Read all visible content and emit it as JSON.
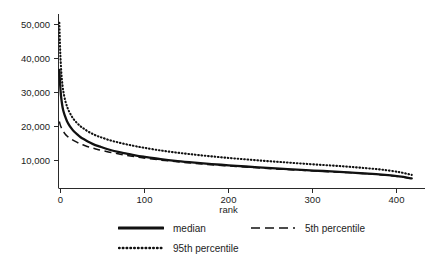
{
  "chart_data": {
    "type": "line",
    "title": "",
    "subtitle": "",
    "xlabel": "rank",
    "ylabel": "",
    "xlim": [
      0,
      420
    ],
    "ylim": [
      5000,
      55000
    ],
    "grid": false,
    "legend_position": "bottom",
    "x_ticks": [
      0,
      100,
      200,
      300,
      400
    ],
    "x_tick_labels": [
      "0",
      "100",
      "200",
      "300",
      "400"
    ],
    "y_ticks": [
      10000,
      20000,
      30000,
      40000,
      50000
    ],
    "y_tick_labels": [
      "10,000",
      "20,000",
      "30,000",
      "40,000",
      "50,000"
    ],
    "x": [
      1,
      2,
      3,
      4,
      5,
      6,
      8,
      10,
      12,
      15,
      18,
      22,
      26,
      30,
      35,
      40,
      45,
      50,
      60,
      70,
      80,
      90,
      100,
      120,
      140,
      160,
      180,
      200,
      220,
      240,
      260,
      280,
      300,
      320,
      340,
      360,
      380,
      400,
      415
    ],
    "series": [
      {
        "name": "median",
        "style": "solid",
        "color": "#111111",
        "values": [
          39000,
          34500,
          31500,
          29500,
          28000,
          27000,
          25500,
          24300,
          23400,
          22300,
          21400,
          20500,
          19700,
          19100,
          18400,
          17800,
          17300,
          16900,
          16100,
          15500,
          15000,
          14500,
          14100,
          13400,
          12850,
          12400,
          12000,
          11650,
          11300,
          11000,
          10700,
          10400,
          10150,
          9900,
          9600,
          9300,
          8950,
          8450,
          7900
        ]
      },
      {
        "name": "5th percentile",
        "style": "dashed",
        "color": "#111111",
        "values": [
          24200,
          23300,
          22600,
          22050,
          21600,
          21200,
          20550,
          20050,
          19650,
          19150,
          18700,
          18200,
          17750,
          17400,
          16950,
          16600,
          16250,
          15950,
          15400,
          14950,
          14500,
          14100,
          13750,
          13150,
          12650,
          12200,
          11800,
          11450,
          11150,
          10850,
          10550,
          10300,
          10050,
          9800,
          9550,
          9250,
          8900,
          8400,
          7850
        ]
      },
      {
        "name": "95th percentile",
        "style": "dotted",
        "color": "#111111",
        "values": [
          52500,
          44500,
          39500,
          36200,
          34000,
          32400,
          30100,
          28500,
          27300,
          25900,
          24800,
          23700,
          22800,
          22100,
          21300,
          20650,
          20100,
          19650,
          18850,
          18200,
          17650,
          17150,
          16700,
          15900,
          15250,
          14700,
          14200,
          13750,
          13350,
          12950,
          12600,
          12250,
          11900,
          11600,
          11250,
          10850,
          10400,
          9700,
          8900
        ]
      }
    ]
  },
  "axes": {
    "x_label": "rank",
    "y_tick_labels": [
      "50,000",
      "40,000",
      "30,000",
      "20,000",
      "10,000"
    ],
    "x_tick_labels": [
      "0",
      "100",
      "200",
      "300",
      "400"
    ]
  },
  "legend": {
    "items": [
      {
        "label": "median",
        "style": "solid"
      },
      {
        "label": "5th percentile",
        "style": "dashed"
      },
      {
        "label": "95th percentile",
        "style": "dotted"
      }
    ]
  }
}
